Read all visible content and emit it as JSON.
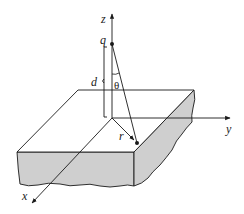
{
  "figure": {
    "colors": {
      "line": "#1a1a1a",
      "slab_side_fill": "#cfcfcf",
      "slab_top_fill": "#ffffff",
      "background": "#ffffff"
    }
  },
  "labels": {
    "z_axis": "z",
    "y_axis": "y",
    "x_axis": "x",
    "charge": "q",
    "distance": "d",
    "angle": "θ",
    "radius": "r"
  }
}
